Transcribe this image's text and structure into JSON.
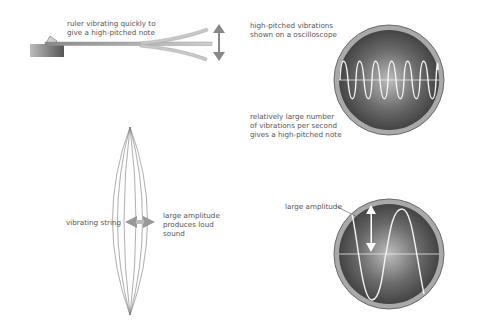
{
  "labels": {
    "ruler": "ruler vibrating quickly to\ngive a high-pitched note",
    "high_pitched_vibrations": "high-pitched vibrations\nshown on a oscilloscope",
    "relatively_large": "relatively large number\nof vibrations per second\ngives a high-pitched note",
    "vibrating_string": "vibrating string",
    "large_amplitude_sound": "large amplitude\nproduces loud\nsound",
    "large_amplitude": "large amplitude"
  },
  "colors": {
    "text": "#555555",
    "screen_dark": "#3c3c3c",
    "screen_light": "#b9b9b9",
    "bezel": "#a8a8a8",
    "trace": "#f4f4f4"
  }
}
